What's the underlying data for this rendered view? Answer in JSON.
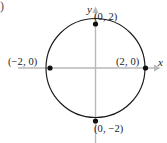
{
  "figure": {
    "width": 167,
    "height": 143,
    "background": "#ffffff",
    "corner_artifact": ")"
  },
  "axes": {
    "color": "#b9b9b9",
    "x_label": "x",
    "y_label": "y",
    "origin_px": {
      "x": 95.5,
      "y": 68
    },
    "x_range_px": {
      "start": 18,
      "end": 158
    },
    "y_range_px": {
      "start": 10,
      "end": 143
    }
  },
  "chart_data": {
    "type": "scatter",
    "title": "",
    "xlabel": "x",
    "ylabel": "y",
    "grid": false,
    "legend": null,
    "xlim": [
      -3.1,
      3.1
    ],
    "ylim": [
      -3.3,
      2.9
    ],
    "curve": {
      "name": "circle",
      "equation": "x^2 + y^2 = 4",
      "center": [
        0,
        0
      ],
      "radius": 2,
      "stroke": "#1b1b1b",
      "fill": "none"
    },
    "points": [
      {
        "label": "(0, 2)",
        "x": 0,
        "y": 2,
        "px": 95.5,
        "py": 24.0,
        "label_x": 94,
        "label_y": 12,
        "marker": "dot"
      },
      {
        "label": "(2, 0)",
        "x": 2,
        "y": 0,
        "px": 145.5,
        "py": 68.0,
        "label_x": 116,
        "label_y": 57,
        "marker": "dot"
      },
      {
        "label": "(0, −2)",
        "x": 0,
        "y": -2,
        "px": 95.5,
        "py": 121.0,
        "label_x": 94,
        "label_y": 124,
        "marker": "dot"
      },
      {
        "label": "(−2, 0)",
        "x": -2,
        "y": 0,
        "px": 50.0,
        "py": 68.0,
        "label_x": 8,
        "label_y": 57,
        "marker": "dot"
      }
    ],
    "marker_color": "#101010"
  }
}
